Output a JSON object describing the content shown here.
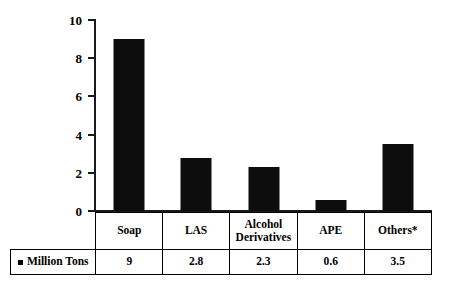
{
  "chart_data": {
    "type": "bar",
    "title": "",
    "subtitle": "",
    "xlabel": "",
    "ylabel": "",
    "categories": [
      "Soap",
      "LAS",
      "Alcohol Derivatives",
      "APE",
      "Others*"
    ],
    "category_lines": [
      [
        "Soap"
      ],
      [
        "LAS"
      ],
      [
        "Alcohol",
        "Derivatives"
      ],
      [
        "APE"
      ],
      [
        "Others*"
      ]
    ],
    "values": [
      9,
      2.8,
      2.3,
      0.6,
      3.5
    ],
    "value_labels": [
      "9",
      "2.8",
      "2.3",
      "0.6",
      "3.5"
    ],
    "series": [
      {
        "name": "Million Tons",
        "values": [
          9,
          2.8,
          2.3,
          0.6,
          3.5
        ],
        "color": "#0d0d0d"
      }
    ],
    "ylim": [
      0,
      10
    ],
    "yticks": [
      0,
      2,
      4,
      6,
      8,
      10
    ],
    "ytick_labels": [
      "0",
      "2",
      "4",
      "6",
      "8",
      "10"
    ],
    "grid": false,
    "legend_position": "data-table-row",
    "bar_color": "#0d0d0d",
    "axis_color": "#1a1a1a"
  },
  "legend": {
    "series_label": "Million Tons",
    "marker": "filled-square-marker"
  },
  "table": {
    "category_row_name": "category-header-row",
    "value_row_name": "value-row"
  }
}
